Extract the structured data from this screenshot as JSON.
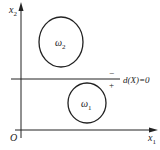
{
  "diagram": {
    "axes": {
      "x_label": "x",
      "x_sub": "1",
      "y_label": "x",
      "y_sub": "2",
      "origin_label": "O"
    },
    "regions": [
      {
        "name": "omega-2",
        "symbol": "ω",
        "sub": "2",
        "cx": 61,
        "cy": 42,
        "rx": 22,
        "ry": 25
      },
      {
        "name": "omega-1",
        "symbol": "ω",
        "sub": "1",
        "cx": 87,
        "cy": 103,
        "rx": 19,
        "ry": 20
      }
    ],
    "boundary": {
      "label": "d(X)=0",
      "negative_side": "−",
      "positive_side": "+"
    },
    "colors": {
      "stroke": "#222222",
      "background": "#ffffff"
    }
  }
}
